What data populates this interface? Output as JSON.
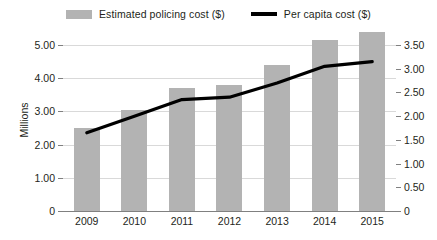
{
  "legend": {
    "entries": [
      {
        "label": "Estimated policing cost ($)",
        "marker": "bar-swatch",
        "color": "#b3b3b3"
      },
      {
        "label": "Per capita cost ($)",
        "marker": "line-swatch",
        "color": "#000000"
      }
    ]
  },
  "axes": {
    "y_left_title": "Millions",
    "y_left_ticks": [
      "0",
      "1.00",
      "2.00",
      "3.00",
      "4.00",
      "5.00"
    ],
    "y_right_ticks": [
      "0",
      "0.50",
      "1.00",
      "1.50",
      "2.00",
      "2.50",
      "3.00",
      "3.50"
    ]
  },
  "chart_data": {
    "type": "bar",
    "title": "",
    "xlabel": "",
    "ylabel": "Millions",
    "categories": [
      "2009",
      "2010",
      "2011",
      "2012",
      "2013",
      "2014",
      "2015"
    ],
    "series": [
      {
        "name": "Estimated policing cost ($)",
        "type": "bar",
        "axis": "left",
        "color": "#b3b3b3",
        "values": [
          2.5,
          3.05,
          3.7,
          3.8,
          4.4,
          5.15,
          5.4
        ]
      },
      {
        "name": "Per capita cost ($)",
        "type": "line",
        "axis": "right",
        "color": "#000000",
        "values": [
          1.65,
          2.0,
          2.35,
          2.4,
          2.7,
          3.05,
          3.15
        ]
      }
    ],
    "ylim": [
      0,
      5.0
    ],
    "y2lim": [
      0,
      3.5
    ],
    "grid": true,
    "legend_position": "top"
  }
}
